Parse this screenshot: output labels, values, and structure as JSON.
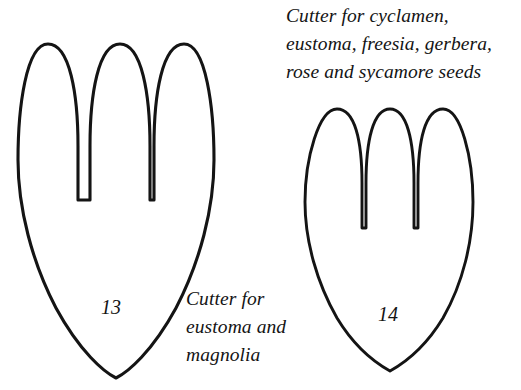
{
  "page": {
    "background_color": "#ffffff",
    "ink_color": "#141414",
    "width": 521,
    "height": 390
  },
  "figures": [
    {
      "id": "figure-13",
      "number": "13",
      "caption": "Cutter for\neustoma and\nmagnolia",
      "caption_lines": [
        "Cutter for",
        "eustoma and",
        "magnolia"
      ],
      "shape": "three-lobed petal outline tapering to a point",
      "lobes": 3,
      "size": "large"
    },
    {
      "id": "figure-14",
      "number": "14",
      "caption": "Cutter for cyclamen,\neustoma, freesia, gerbera,\nrose and sycamore seeds",
      "caption_lines": [
        "Cutter for cyclamen,",
        "eustoma, freesia, gerbera,",
        "rose and sycamore seeds"
      ],
      "shape": "three-lobed petal outline tapering to a point",
      "lobes": 3,
      "size": "small"
    }
  ]
}
